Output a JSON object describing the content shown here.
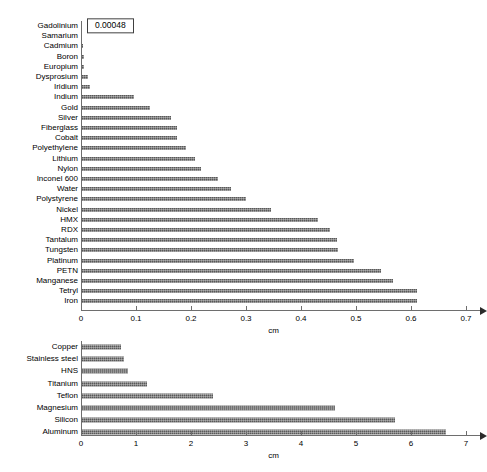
{
  "chart_data": [
    {
      "type": "bar",
      "orientation": "horizontal",
      "id": "top-chart",
      "title": "",
      "xlabel": "cm",
      "ylabel": "",
      "xlim": [
        0,
        0.7
      ],
      "xticks": [
        "0",
        "0.1",
        "0.2",
        "0.3",
        "0.4",
        "0.5",
        "0.6",
        "0.7"
      ],
      "xtick_values": [
        0,
        0.1,
        0.2,
        0.3,
        0.4,
        0.5,
        0.6,
        0.7
      ],
      "grid": false,
      "legend": "none",
      "bar_color": "#595959",
      "categories": [
        "Gadolinium",
        "Samarium",
        "Cadmium",
        "Boron",
        "Europium",
        "Dysprosium",
        "Iridium",
        "Indium",
        "Gold",
        "Silver",
        "Fiberglass",
        "Cobalt",
        "Polyethylene",
        "Lithium",
        "Nylon",
        "Inconel 600",
        "Water",
        "Polystyrene",
        "Nickel",
        "HMX",
        "RDX",
        "Tantalum",
        "Tungsten",
        "Platinum",
        "PETN",
        "Manganese",
        "Tetryl",
        "Iron"
      ],
      "values": [
        0.00048,
        0.0016,
        0.004,
        0.005,
        0.006,
        0.012,
        0.017,
        0.097,
        0.125,
        0.163,
        0.175,
        0.175,
        0.19,
        0.207,
        0.219,
        0.249,
        0.273,
        0.3,
        0.345,
        0.43,
        0.452,
        0.465,
        0.468,
        0.497,
        0.546,
        0.568,
        0.61,
        0.61
      ],
      "annotations": [
        {
          "category": "Gadolinium",
          "text": "0.00048",
          "style": "boxed-callout"
        }
      ]
    },
    {
      "type": "bar",
      "orientation": "horizontal",
      "id": "bottom-chart",
      "title": "",
      "xlabel": "cm",
      "ylabel": "",
      "xlim": [
        0,
        7
      ],
      "xticks": [
        "0",
        "1",
        "2",
        "3",
        "4",
        "5",
        "6",
        "7"
      ],
      "xtick_values": [
        0,
        1,
        2,
        3,
        4,
        5,
        6,
        7
      ],
      "grid": false,
      "legend": "none",
      "bar_color": "#595959",
      "categories": [
        "Copper",
        "Stainless steel",
        "HNS",
        "Titanium",
        "Teflon",
        "Magnesium",
        "Silicon",
        "Aluminum"
      ],
      "values": [
        0.72,
        0.78,
        0.86,
        1.2,
        2.4,
        4.62,
        5.7,
        6.63
      ],
      "annotations": []
    }
  ]
}
